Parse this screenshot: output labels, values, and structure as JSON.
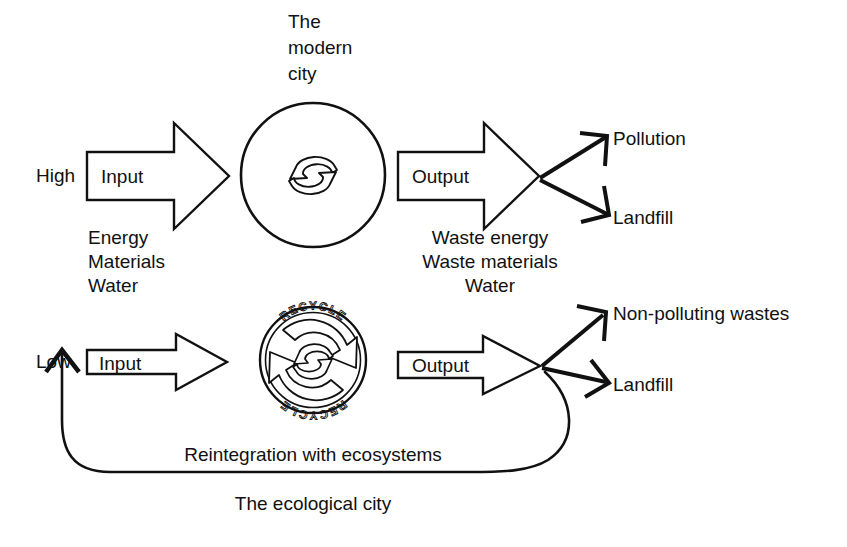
{
  "diagram": {
    "title_top": "The\nmodern\ncity",
    "title_bottom": "The ecological city",
    "top": {
      "caption_lines": [
        "The",
        "modern",
        "city"
      ],
      "input_level": "High",
      "input_label": "Input",
      "input_items": [
        "Energy",
        "Materials",
        "Water"
      ],
      "output_label": "Output",
      "output_items": [
        "Waste energy",
        "Waste materials",
        "Water"
      ],
      "destinations": [
        "Pollution",
        "Landfill"
      ],
      "hub_icon": "cycle-icon"
    },
    "bottom": {
      "input_level": "Low",
      "input_label": "Input",
      "output_label": "Output",
      "destinations": [
        "Non-polluting wastes",
        "Landfill"
      ],
      "hub_icon": "recycle-icon",
      "hub_text_top": "RECYCLE",
      "hub_text_bottom": "RECYCLE",
      "feedback_label": "Reintegration with ecosystems",
      "caption": "The ecological city"
    },
    "colors": {
      "ink": "#111111",
      "background": "#ffffff"
    }
  }
}
